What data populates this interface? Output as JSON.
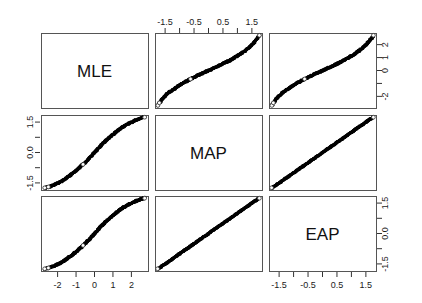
{
  "figure": {
    "type": "scatterplot-matrix",
    "variables": [
      "MLE",
      "MAP",
      "EAP"
    ],
    "background": "#ffffff",
    "point_color": "#000000",
    "panel_border_color": "#555555"
  },
  "diagonal_labels": {
    "mle": "MLE",
    "map": "MAP",
    "eap": "EAP"
  },
  "axes": {
    "top_col2": {
      "labels": [
        "-1.5",
        "-0.5",
        "0.5",
        "1.5"
      ],
      "values": [
        -1.5,
        -0.5,
        0.5,
        1.5
      ],
      "minor_values": [
        -2.0,
        -1.0,
        0.0,
        1.0,
        2.0
      ]
    },
    "right_row1": {
      "labels": [
        "-2",
        "0",
        "1",
        "2"
      ],
      "values": [
        -2,
        0,
        1,
        2
      ],
      "minor_values": [
        -1
      ]
    },
    "left_row2": {
      "labels": [
        "1.5",
        "0.0",
        "-1.5"
      ],
      "values": [
        1.5,
        0.0,
        -1.5
      ],
      "minor_values": [
        0.75,
        -0.75
      ]
    },
    "right_row3": {
      "labels": [
        "1.5",
        "0.0",
        "-1.5"
      ],
      "values": [
        1.5,
        0.0,
        -1.5
      ],
      "minor_values": [
        0.75,
        -0.75
      ]
    },
    "bottom_col1": {
      "labels": [
        "-2",
        "-1",
        "0",
        "1",
        "2"
      ],
      "values": [
        -2,
        -1,
        0,
        1,
        2
      ],
      "minor_values": []
    },
    "bottom_col3": {
      "labels": [
        "-1.5",
        "-0.5",
        "0.5",
        "1.5"
      ],
      "values": [
        -1.5,
        -0.5,
        0.5,
        1.5
      ],
      "minor_values": [
        -2.0,
        -1.0,
        0.0,
        1.0,
        2.0
      ]
    }
  },
  "chart_data": {
    "type": "scatter",
    "title": "",
    "xlabel": "",
    "ylabel": "",
    "variables": [
      "MLE",
      "MAP",
      "EAP"
    ],
    "matrix_layout": "3x3 pairs matrix; diagonal shows variable name; off-diagonal shows bivariate scatter",
    "axis_ranges": {
      "MLE": [
        -2.9,
        2.9
      ],
      "MAP": [
        -1.85,
        1.85
      ],
      "EAP": [
        -1.85,
        1.85
      ]
    },
    "relationships": [
      {
        "row": "MLE",
        "col": "MAP",
        "shape": "monotone sigmoid / ogive (MLE expands at the tails relative to MAP)",
        "correlation_note": "very high, non-linear",
        "x": [
          -1.75,
          -1.7,
          -1.62,
          -1.52,
          -1.4,
          -1.25,
          -1.08,
          -0.9,
          -0.7,
          -0.5,
          -0.3,
          -0.1,
          0.1,
          0.3,
          0.5,
          0.7,
          0.9,
          1.08,
          1.25,
          1.4,
          1.52,
          1.62,
          1.7,
          1.76
        ],
        "y": [
          -2.7,
          -2.5,
          -2.25,
          -2.0,
          -1.75,
          -1.5,
          -1.25,
          -1.0,
          -0.75,
          -0.52,
          -0.3,
          -0.1,
          0.1,
          0.3,
          0.52,
          0.75,
          1.0,
          1.25,
          1.5,
          1.78,
          2.05,
          2.3,
          2.52,
          2.72
        ]
      },
      {
        "row": "MLE",
        "col": "EAP",
        "shape": "monotone sigmoid / ogive (MLE expands at the tails relative to EAP)",
        "correlation_note": "very high, non-linear",
        "x": [
          -1.75,
          -1.7,
          -1.62,
          -1.52,
          -1.4,
          -1.25,
          -1.08,
          -0.9,
          -0.7,
          -0.5,
          -0.3,
          -0.1,
          0.1,
          0.3,
          0.5,
          0.7,
          0.9,
          1.08,
          1.25,
          1.4,
          1.52,
          1.62,
          1.7,
          1.76
        ],
        "y": [
          -2.7,
          -2.5,
          -2.25,
          -2.0,
          -1.75,
          -1.5,
          -1.25,
          -1.0,
          -0.75,
          -0.52,
          -0.3,
          -0.1,
          0.1,
          0.3,
          0.52,
          0.75,
          1.0,
          1.25,
          1.5,
          1.78,
          2.05,
          2.3,
          2.52,
          2.72
        ]
      },
      {
        "row": "MAP",
        "col": "MLE",
        "shape": "monotone inverse ogive (compresses at tails)",
        "correlation_note": "very high, non-linear",
        "x": [
          -2.7,
          -2.5,
          -2.25,
          -2.0,
          -1.75,
          -1.5,
          -1.25,
          -1.0,
          -0.75,
          -0.52,
          -0.3,
          -0.1,
          0.1,
          0.3,
          0.52,
          0.75,
          1.0,
          1.25,
          1.5,
          1.78,
          2.05,
          2.3,
          2.52,
          2.72
        ],
        "y": [
          -1.75,
          -1.7,
          -1.62,
          -1.52,
          -1.4,
          -1.25,
          -1.08,
          -0.9,
          -0.7,
          -0.5,
          -0.3,
          -0.1,
          0.1,
          0.3,
          0.5,
          0.7,
          0.9,
          1.08,
          1.25,
          1.4,
          1.52,
          1.62,
          1.7,
          1.76
        ]
      },
      {
        "row": "MAP",
        "col": "EAP",
        "shape": "straight line, near-perfect positive linear relation",
        "correlation_note": "approximately 1.00",
        "x": [
          -1.76,
          -1.5,
          -1.25,
          -1.0,
          -0.75,
          -0.5,
          -0.25,
          0.0,
          0.25,
          0.5,
          0.75,
          1.0,
          1.25,
          1.5,
          1.76
        ],
        "y": [
          -1.76,
          -1.5,
          -1.25,
          -1.0,
          -0.75,
          -0.5,
          -0.25,
          0.0,
          0.25,
          0.5,
          0.75,
          1.0,
          1.25,
          1.5,
          1.76
        ]
      },
      {
        "row": "EAP",
        "col": "MLE",
        "shape": "monotone inverse ogive (compresses at tails)",
        "correlation_note": "very high, non-linear",
        "x": [
          -2.7,
          -2.5,
          -2.25,
          -2.0,
          -1.75,
          -1.5,
          -1.25,
          -1.0,
          -0.75,
          -0.52,
          -0.3,
          -0.1,
          0.1,
          0.3,
          0.52,
          0.75,
          1.0,
          1.25,
          1.5,
          1.78,
          2.05,
          2.3,
          2.52,
          2.72
        ],
        "y": [
          -1.75,
          -1.7,
          -1.62,
          -1.52,
          -1.4,
          -1.25,
          -1.08,
          -0.9,
          -0.7,
          -0.5,
          -0.3,
          -0.1,
          0.1,
          0.3,
          0.5,
          0.7,
          0.9,
          1.08,
          1.25,
          1.4,
          1.52,
          1.62,
          1.7,
          1.76
        ]
      },
      {
        "row": "EAP",
        "col": "MAP",
        "shape": "straight line, near-perfect positive linear relation",
        "correlation_note": "approximately 1.00",
        "x": [
          -1.76,
          -1.5,
          -1.25,
          -1.0,
          -0.75,
          -0.5,
          -0.25,
          0.0,
          0.25,
          0.5,
          0.75,
          1.0,
          1.25,
          1.5,
          1.76
        ],
        "y": [
          -1.76,
          -1.5,
          -1.25,
          -1.0,
          -0.75,
          -0.5,
          -0.25,
          0.0,
          0.25,
          0.5,
          0.75,
          1.0,
          1.25,
          1.5,
          1.76
        ]
      }
    ],
    "grid": false,
    "legend": null
  }
}
